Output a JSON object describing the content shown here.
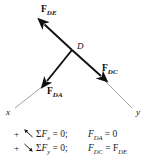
{
  "figure": {
    "joint_label": "D",
    "axes": {
      "x_label": "x",
      "y_label": "y"
    },
    "forces": [
      {
        "name": "F_DE",
        "base": "F",
        "sub": "DE",
        "direction": "up-left"
      },
      {
        "name": "F_DA",
        "base": "F",
        "sub": "DA",
        "direction": "down-left"
      },
      {
        "name": "F_DC",
        "base": "F",
        "sub": "DC",
        "direction": "down-right"
      }
    ],
    "colors": {
      "vector": "#111111",
      "axis_line": "#8a8a8a",
      "text": "#1a1a1a",
      "background": "#ffffff"
    }
  },
  "equations": {
    "rows": [
      {
        "plus": "+",
        "arrow": "up-left-arrow-icon",
        "sum": "Σ",
        "force": "F",
        "axis_sub": "x",
        "equals_zero": "= 0;",
        "result_force": "F",
        "result_sub": "DA",
        "result_rhs": "= 0"
      },
      {
        "plus": "+",
        "arrow": "down-right-arrow-icon",
        "sum": "Σ",
        "force": "F",
        "axis_sub": "y",
        "equals_zero": "= 0;",
        "result_force": "F",
        "result_sub": "DC",
        "result_rhs": "= F",
        "result_rhs_sub": "DE"
      }
    ]
  }
}
